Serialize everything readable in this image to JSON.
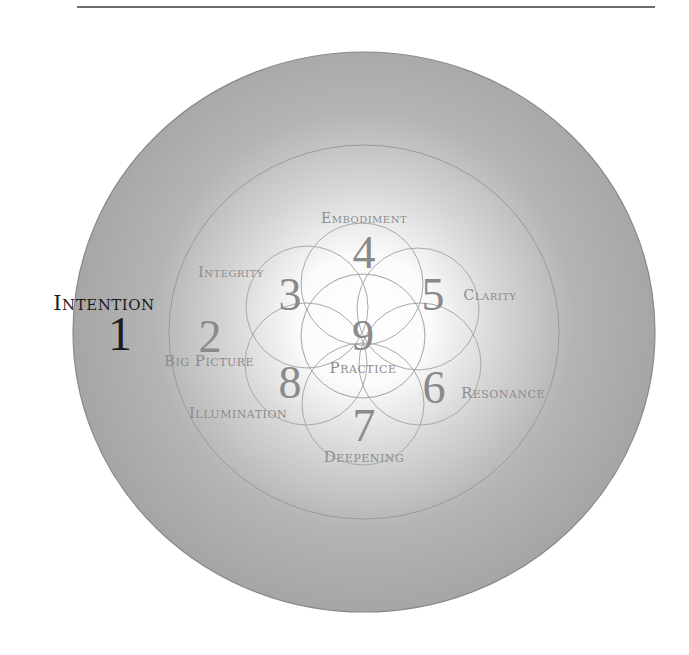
{
  "diagram": {
    "colors": {
      "outer_ring": "#a6a6a6",
      "center_glow": "#ffffff",
      "stroke": "#8f8f8f",
      "label": "#8c8c8c",
      "emphasis": "#1c1c1c"
    },
    "stages": [
      {
        "number": "1",
        "label": "Intention",
        "ring": "outer",
        "emphasized": true
      },
      {
        "number": "2",
        "label": "Big Picture",
        "ring": "middle"
      },
      {
        "number": "3",
        "label": "Integrity",
        "ring": "petal"
      },
      {
        "number": "4",
        "label": "Embodiment",
        "ring": "petal"
      },
      {
        "number": "5",
        "label": "Clarity",
        "ring": "petal"
      },
      {
        "number": "6",
        "label": "Resonance",
        "ring": "petal"
      },
      {
        "number": "7",
        "label": "Deepening",
        "ring": "petal"
      },
      {
        "number": "8",
        "label": "Illumination",
        "ring": "petal"
      },
      {
        "number": "9",
        "label": "Practice",
        "ring": "center"
      }
    ]
  }
}
